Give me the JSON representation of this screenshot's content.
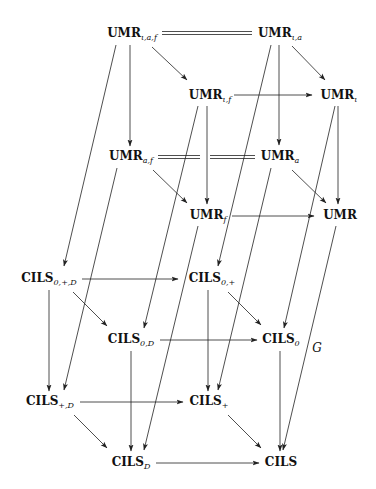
{
  "diagram": {
    "nodes": {
      "umr_iaf": {
        "base": "UMR",
        "sub": "ι,a,f"
      },
      "umr_ia": {
        "base": "UMR",
        "sub": "ι,a"
      },
      "umr_if": {
        "base": "UMR",
        "sub": "ι,f"
      },
      "umr_i": {
        "base": "UMR",
        "sub": "ι"
      },
      "umr_af": {
        "base": "UMR",
        "sub": "a,f"
      },
      "umr_a": {
        "base": "UMR",
        "sub": "a"
      },
      "umr_f": {
        "base": "UMR",
        "sub": "f"
      },
      "umr": {
        "base": "UMR",
        "sub": ""
      },
      "cils_0pD": {
        "base": "CILS",
        "sub": "0,+,D"
      },
      "cils_0p": {
        "base": "CILS",
        "sub": "0,+"
      },
      "cils_0D": {
        "base": "CILS",
        "sub": "0,D"
      },
      "cils_0": {
        "base": "CILS",
        "sub": "0"
      },
      "cils_pD": {
        "base": "CILS",
        "sub": "+,D"
      },
      "cils_p": {
        "base": "CILS",
        "sub": "+"
      },
      "cils_D": {
        "base": "CILS",
        "sub": "D"
      },
      "cils": {
        "base": "CILS",
        "sub": ""
      }
    },
    "edge_labels": {
      "g": "G"
    },
    "edges": [
      {
        "from": "umr_iaf",
        "to": "umr_ia",
        "type": "equality"
      },
      {
        "from": "umr_af",
        "to": "umr_a",
        "type": "equality"
      },
      {
        "from": "umr_iaf",
        "to": "umr_if",
        "type": "arrow"
      },
      {
        "from": "umr_iaf",
        "to": "umr_af",
        "type": "arrow"
      },
      {
        "from": "umr_iaf",
        "to": "cils_0pD",
        "type": "arrow"
      },
      {
        "from": "umr_ia",
        "to": "umr_i",
        "type": "arrow"
      },
      {
        "from": "umr_ia",
        "to": "umr_a",
        "type": "arrow"
      },
      {
        "from": "umr_ia",
        "to": "cils_0p",
        "type": "arrow"
      },
      {
        "from": "umr_if",
        "to": "umr_i",
        "type": "arrow"
      },
      {
        "from": "umr_if",
        "to": "umr_f",
        "type": "arrow"
      },
      {
        "from": "umr_if",
        "to": "cils_0D",
        "type": "arrow"
      },
      {
        "from": "umr_i",
        "to": "umr",
        "type": "arrow"
      },
      {
        "from": "umr_i",
        "to": "cils_0",
        "type": "arrow"
      },
      {
        "from": "umr_af",
        "to": "umr_f",
        "type": "arrow"
      },
      {
        "from": "umr_af",
        "to": "cils_pD",
        "type": "arrow"
      },
      {
        "from": "umr_a",
        "to": "umr",
        "type": "arrow"
      },
      {
        "from": "umr_a",
        "to": "cils_p",
        "type": "arrow"
      },
      {
        "from": "umr_f",
        "to": "umr",
        "type": "arrow"
      },
      {
        "from": "umr_f",
        "to": "cils_D",
        "type": "arrow"
      },
      {
        "from": "umr",
        "to": "cils",
        "type": "arrow",
        "label": "G"
      },
      {
        "from": "cils_0pD",
        "to": "cils_0p",
        "type": "arrow"
      },
      {
        "from": "cils_0pD",
        "to": "cils_0D",
        "type": "arrow"
      },
      {
        "from": "cils_0pD",
        "to": "cils_pD",
        "type": "arrow"
      },
      {
        "from": "cils_0p",
        "to": "cils_0",
        "type": "arrow"
      },
      {
        "from": "cils_0p",
        "to": "cils_p",
        "type": "arrow"
      },
      {
        "from": "cils_0D",
        "to": "cils_0",
        "type": "arrow"
      },
      {
        "from": "cils_0D",
        "to": "cils_D",
        "type": "arrow"
      },
      {
        "from": "cils_0",
        "to": "cils",
        "type": "arrow"
      },
      {
        "from": "cils_pD",
        "to": "cils_p",
        "type": "arrow"
      },
      {
        "from": "cils_pD",
        "to": "cils_D",
        "type": "arrow"
      },
      {
        "from": "cils_p",
        "to": "cils",
        "type": "arrow"
      },
      {
        "from": "cils_D",
        "to": "cils",
        "type": "arrow"
      }
    ]
  }
}
